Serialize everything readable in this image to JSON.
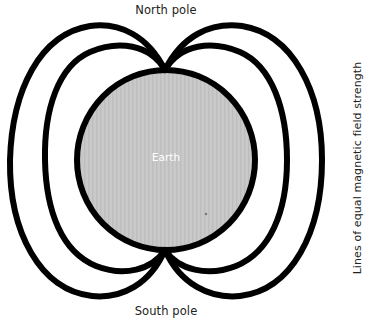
{
  "diagram": {
    "labels": {
      "north_pole": "North pole",
      "south_pole": "South pole",
      "earth": "Earth",
      "field_lines": "Lines of equal magnetic field strength"
    },
    "colors": {
      "earth_fill": "#c8c8c8",
      "stroke": "#000000",
      "background": "#ffffff",
      "text": "#222222",
      "earth_text": "#ffffff"
    },
    "components": [
      {
        "id": "earth",
        "type": "circle",
        "label": "Earth"
      },
      {
        "id": "inner-field-lines",
        "type": "loop-pair",
        "description": "Inner pair of field lines, left and right of Earth"
      },
      {
        "id": "outer-field-lines",
        "type": "loop-pair",
        "description": "Outer pair of field lines, left and right of Earth"
      }
    ]
  }
}
